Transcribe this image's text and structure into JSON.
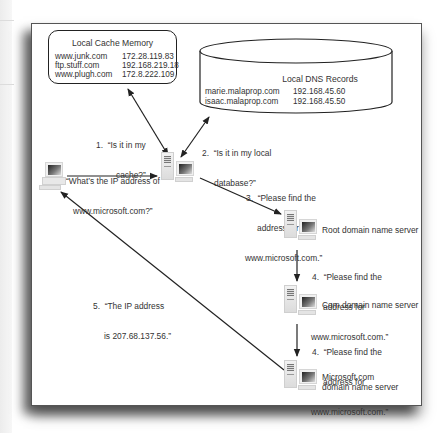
{
  "diagram": {
    "local_cache": {
      "title": "Local Cache Memory",
      "entries": [
        {
          "host": "www.junk.com",
          "ip": "172.28.119.83"
        },
        {
          "host": "ftp.stuff.com",
          "ip": "192.168.219.18"
        },
        {
          "host": "www.plugh.com",
          "ip": "172.8.222.109"
        }
      ]
    },
    "local_dns": {
      "title": "Local DNS Records",
      "entries": [
        {
          "host": "marie.malaprop.com",
          "ip": "192.168.45.60"
        },
        {
          "host": "isaac.malaprop.com",
          "ip": "192.168.45.50"
        }
      ]
    },
    "client_query": {
      "line1": "“What’s the IP address of",
      "line2": "www.microsoft.com?”"
    },
    "steps": [
      {
        "line1": "1.  “Is it in my",
        "line2": "cache?”"
      },
      {
        "line1": "2.  “Is it in my local",
        "line2": "database?”"
      },
      {
        "line1": "3.  “Please find the",
        "line2": "address for",
        "line3": "www.microsoft.com.”"
      },
      {
        "line1": "4.  “Please find the",
        "line2": "address for",
        "line3": "www.microsoft.com.”"
      },
      {
        "line1": "4.  “Please find the",
        "line2": "address for",
        "line3": "www.microsoft.com.”"
      },
      {
        "line1": "5.  “The IP address",
        "line2": "is 207.68.137.56.”"
      }
    ],
    "servers": [
      {
        "label1": "Root domain name server",
        "label2": ""
      },
      {
        "label1": "Com domain name server",
        "label2": ""
      },
      {
        "label1": "Microsoft.com",
        "label2": "domain name server"
      }
    ],
    "icons": {
      "client": "desktop-computer-icon",
      "local_server": "server-computer-icon",
      "root_server": "server-computer-icon",
      "com_server": "server-computer-icon",
      "microsoft_server": "server-computer-icon"
    },
    "colors": {
      "line": "#222222",
      "text": "#333333",
      "frame_border": "#555555"
    }
  }
}
